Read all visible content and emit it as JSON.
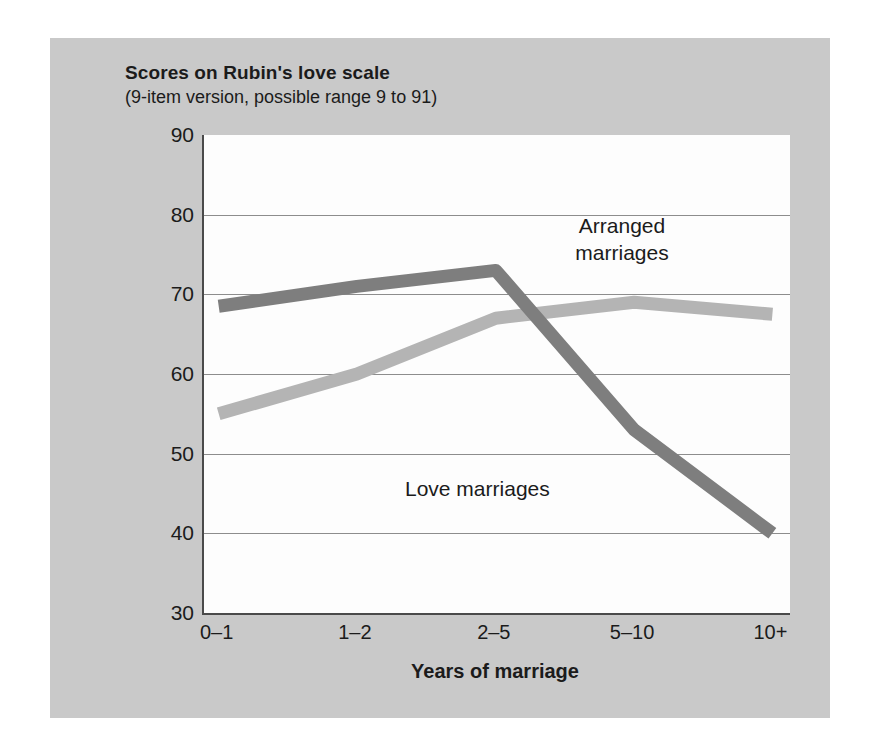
{
  "chart_data": {
    "type": "line",
    "title": "Scores on Rubin's love scale",
    "subtitle": "(9-item version, possible range 9 to 91)",
    "xlabel": "Years of marriage",
    "ylabel": "",
    "categories": [
      "0–1",
      "1–2",
      "2–5",
      "5–10",
      "10+"
    ],
    "ylim": [
      30,
      90
    ],
    "yticks": [
      30,
      40,
      50,
      60,
      70,
      80,
      90
    ],
    "grid": true,
    "legend_position": "inline-annotations",
    "series": [
      {
        "name": "Love marriages",
        "color": "#7e7e7e",
        "values": [
          68.5,
          71.0,
          73.0,
          53.0,
          40.0
        ]
      },
      {
        "name": "Arranged marriages",
        "color": "#b4b4b4",
        "values": [
          55.0,
          60.0,
          67.0,
          69.0,
          67.5
        ]
      }
    ],
    "annotations": [
      {
        "text": "Arranged\nmarriages",
        "series": "Arranged marriages"
      },
      {
        "text": "Love marriages",
        "series": "Love marriages"
      }
    ]
  },
  "ticks": {
    "y": [
      "90",
      "80",
      "70",
      "60",
      "50",
      "40",
      "30"
    ],
    "x": [
      "0–1",
      "1–2",
      "2–5",
      "5–10",
      "10+"
    ]
  },
  "labels": {
    "title": "Scores on Rubin's love scale",
    "subtitle": "(9-item version, possible range 9 to 91)",
    "x_axis": "Years of marriage",
    "annotation_arranged": "Arranged\nmarriages",
    "annotation_love": "Love marriages"
  },
  "colors": {
    "panel_background": "#c9c9c9",
    "plot_background": "#fdfdfd",
    "axis": "#4a4a4a",
    "gridline": "#8d8d8d",
    "series_love": "#7e7e7e",
    "series_arranged": "#b4b4b4",
    "text": "#1b1b1b"
  }
}
